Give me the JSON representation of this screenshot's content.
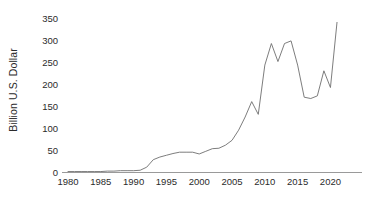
{
  "chart_data": {
    "type": "line",
    "title": "",
    "subtitle": "",
    "xlabel": "",
    "ylabel": "Billion U.S. Dollar",
    "ylim": [
      0,
      350
    ],
    "xlim": [
      1980,
      2021
    ],
    "grid": false,
    "legend": null,
    "y_ticks": [
      0,
      50,
      100,
      150,
      200,
      250,
      300,
      350
    ],
    "y_tick_labels": [
      "0",
      "50",
      "100",
      "150",
      "200",
      "250",
      "300",
      "350"
    ],
    "x_ticks": [
      1980,
      1985,
      1990,
      1995,
      2000,
      2005,
      2010,
      2015,
      2020
    ],
    "x_tick_labels": [
      "1980",
      "1985",
      "1990",
      "1995",
      "2000",
      "2005",
      "2010",
      "2015",
      "2020"
    ],
    "line_color": "#6e6e6e",
    "line_width": 1,
    "x": [
      1980,
      1981,
      1982,
      1983,
      1984,
      1985,
      1986,
      1987,
      1988,
      1989,
      1990,
      1991,
      1992,
      1993,
      1994,
      1995,
      1996,
      1997,
      1998,
      1999,
      2000,
      2001,
      2002,
      2003,
      2004,
      2005,
      2006,
      2007,
      2008,
      2009,
      2010,
      2011,
      2012,
      2013,
      2014,
      2015,
      2016,
      2017,
      2018,
      2019,
      2020,
      2021
    ],
    "values": [
      1,
      1,
      1,
      1,
      1,
      1,
      2,
      2,
      3,
      3,
      3,
      4,
      11,
      28,
      34,
      38,
      42,
      45,
      45,
      45,
      41,
      47,
      53,
      54,
      61,
      72,
      95,
      125,
      160,
      131,
      243,
      292,
      251,
      292,
      298,
      243,
      170,
      167,
      173,
      230,
      192,
      340
    ],
    "annotations": []
  },
  "axes": {
    "y_axis_name": "y-axis",
    "x_axis_name": "x-axis"
  }
}
